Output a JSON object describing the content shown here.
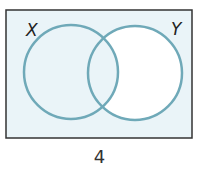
{
  "diagram": {
    "type": "venn",
    "sets": [
      {
        "name": "X",
        "label": "X"
      },
      {
        "name": "Y",
        "label": "Y"
      }
    ],
    "shaded_region": "X ∪ Y′ (everything except Y only)",
    "unshaded_region": "Y only",
    "caption": "4",
    "colors": {
      "shade": "#eaf4f8",
      "circle_stroke": "#6fa9b8",
      "border": "#333333",
      "unshaded": "#ffffff"
    }
  }
}
